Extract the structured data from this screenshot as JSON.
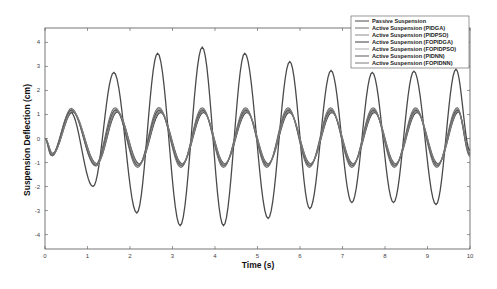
{
  "chart_data": {
    "type": "line",
    "title": "",
    "xlabel": "Time (s)",
    "ylabel": "Suspension Deflection (cm)",
    "xlim": [
      0,
      10
    ],
    "ylim": [
      -4.6,
      4.6
    ],
    "xticks": [
      0,
      1,
      2,
      3,
      4,
      5,
      6,
      7,
      8,
      9,
      10
    ],
    "yticks": [
      -4,
      -3,
      -2,
      -1,
      0,
      1,
      2,
      3,
      4
    ],
    "grid": false,
    "legend_position": "upper right",
    "series": [
      {
        "name": "Passive Suspension",
        "color": "#4a4a4a",
        "points": [
          [
            0,
            0
          ],
          [
            0.15,
            -0.7
          ],
          [
            0.6,
            1.1
          ],
          [
            1.13,
            -2.0
          ],
          [
            1.62,
            2.75
          ],
          [
            2.16,
            -3.1
          ],
          [
            2.65,
            3.55
          ],
          [
            3.18,
            -3.63
          ],
          [
            3.7,
            3.8
          ],
          [
            4.2,
            -3.63
          ],
          [
            4.7,
            3.55
          ],
          [
            5.25,
            -3.33
          ],
          [
            5.76,
            3.2
          ],
          [
            6.23,
            -2.92
          ],
          [
            6.73,
            2.83
          ],
          [
            7.22,
            -2.67
          ],
          [
            7.7,
            2.75
          ],
          [
            8.2,
            -2.67
          ],
          [
            8.68,
            2.8
          ],
          [
            9.2,
            -2.75
          ],
          [
            9.67,
            2.88
          ],
          [
            10,
            -0.5
          ]
        ]
      },
      {
        "name": "Active Suspension (PIDGA)",
        "color": "#6e6e6e",
        "points": [
          [
            0,
            0
          ],
          [
            0.17,
            -0.72
          ],
          [
            0.62,
            1.25
          ],
          [
            1.18,
            -1.1
          ],
          [
            1.65,
            1.28
          ],
          [
            2.18,
            -1.2
          ],
          [
            2.68,
            1.29
          ],
          [
            3.2,
            -1.2
          ],
          [
            3.7,
            1.28
          ],
          [
            4.2,
            -1.2
          ],
          [
            4.72,
            1.28
          ],
          [
            5.22,
            -1.2
          ],
          [
            5.72,
            1.28
          ],
          [
            6.22,
            -1.2
          ],
          [
            6.72,
            1.28
          ],
          [
            7.22,
            -1.2
          ],
          [
            7.72,
            1.28
          ],
          [
            8.22,
            -1.2
          ],
          [
            8.72,
            1.28
          ],
          [
            9.22,
            -1.2
          ],
          [
            9.7,
            1.28
          ],
          [
            10,
            -0.75
          ]
        ]
      },
      {
        "name": "Active Suspension (PIDPSO)",
        "color": "#8a8a8a",
        "points": [
          [
            0,
            0
          ],
          [
            0.16,
            -0.68
          ],
          [
            0.63,
            1.2
          ],
          [
            1.2,
            -1.15
          ],
          [
            1.67,
            1.22
          ],
          [
            2.2,
            -1.15
          ],
          [
            2.69,
            1.24
          ],
          [
            3.21,
            -1.15
          ],
          [
            3.71,
            1.23
          ],
          [
            4.21,
            -1.15
          ],
          [
            4.73,
            1.23
          ],
          [
            5.23,
            -1.15
          ],
          [
            5.73,
            1.23
          ],
          [
            6.23,
            -1.15
          ],
          [
            6.73,
            1.23
          ],
          [
            7.23,
            -1.15
          ],
          [
            7.73,
            1.23
          ],
          [
            8.23,
            -1.15
          ],
          [
            8.73,
            1.23
          ],
          [
            9.23,
            -1.15
          ],
          [
            9.71,
            1.23
          ],
          [
            10,
            -0.7
          ]
        ]
      },
      {
        "name": "Active Suspension  (FOPIDGA)",
        "color": "#3c3c3c",
        "points": [
          [
            0,
            0
          ],
          [
            0.18,
            -0.62
          ],
          [
            0.65,
            1.1
          ],
          [
            1.22,
            -1.05
          ],
          [
            1.7,
            1.1
          ],
          [
            2.22,
            -1.05
          ],
          [
            2.72,
            1.08
          ],
          [
            3.23,
            -1.05
          ],
          [
            3.73,
            1.08
          ],
          [
            4.23,
            -1.05
          ],
          [
            4.75,
            1.08
          ],
          [
            5.25,
            -1.05
          ],
          [
            5.75,
            1.08
          ],
          [
            6.25,
            -1.05
          ],
          [
            6.75,
            1.08
          ],
          [
            7.25,
            -1.05
          ],
          [
            7.75,
            1.08
          ],
          [
            8.25,
            -1.05
          ],
          [
            8.75,
            1.08
          ],
          [
            9.25,
            -1.05
          ],
          [
            9.73,
            1.1
          ],
          [
            10,
            -0.6
          ]
        ]
      },
      {
        "name": "Active Suspension (FOPIDPSO)",
        "color": "#a8a8a8",
        "points": [
          [
            0,
            0
          ],
          [
            0.17,
            -0.66
          ],
          [
            0.64,
            1.15
          ],
          [
            1.21,
            -1.08
          ],
          [
            1.68,
            1.15
          ],
          [
            2.21,
            -1.08
          ],
          [
            2.7,
            1.15
          ],
          [
            3.22,
            -1.08
          ],
          [
            3.72,
            1.15
          ],
          [
            4.22,
            -1.08
          ],
          [
            4.74,
            1.15
          ],
          [
            5.24,
            -1.08
          ],
          [
            5.74,
            1.15
          ],
          [
            6.24,
            -1.08
          ],
          [
            6.74,
            1.15
          ],
          [
            7.24,
            -1.08
          ],
          [
            7.74,
            1.15
          ],
          [
            8.24,
            -1.08
          ],
          [
            8.74,
            1.15
          ],
          [
            9.24,
            -1.08
          ],
          [
            9.72,
            1.15
          ],
          [
            10,
            -0.65
          ]
        ]
      },
      {
        "name": "Active Suspension (PIDNN)",
        "color": "#5a5a5a",
        "points": [
          [
            0,
            0
          ],
          [
            0.16,
            -0.7
          ],
          [
            0.62,
            1.18
          ],
          [
            1.19,
            -1.12
          ],
          [
            1.66,
            1.18
          ],
          [
            2.19,
            -1.12
          ],
          [
            2.69,
            1.18
          ],
          [
            3.21,
            -1.12
          ],
          [
            3.71,
            1.18
          ],
          [
            4.21,
            -1.12
          ],
          [
            4.73,
            1.18
          ],
          [
            5.23,
            -1.12
          ],
          [
            5.73,
            1.18
          ],
          [
            6.23,
            -1.12
          ],
          [
            6.73,
            1.18
          ],
          [
            7.23,
            -1.12
          ],
          [
            7.73,
            1.18
          ],
          [
            8.23,
            -1.12
          ],
          [
            8.73,
            1.18
          ],
          [
            9.23,
            -1.12
          ],
          [
            9.71,
            1.18
          ],
          [
            10,
            -0.68
          ]
        ]
      },
      {
        "name": "Active Suspension (FOPIDNN)",
        "color": "#7a7a7a",
        "points": [
          [
            0,
            0
          ],
          [
            0.18,
            -0.64
          ],
          [
            0.64,
            1.12
          ],
          [
            1.21,
            -1.06
          ],
          [
            1.69,
            1.12
          ],
          [
            2.21,
            -1.06
          ],
          [
            2.71,
            1.12
          ],
          [
            3.22,
            -1.06
          ],
          [
            3.72,
            1.12
          ],
          [
            4.22,
            -1.06
          ],
          [
            4.74,
            1.12
          ],
          [
            5.24,
            -1.06
          ],
          [
            5.74,
            1.12
          ],
          [
            6.24,
            -1.06
          ],
          [
            6.74,
            1.12
          ],
          [
            7.24,
            -1.06
          ],
          [
            7.74,
            1.12
          ],
          [
            8.24,
            -1.06
          ],
          [
            8.74,
            1.12
          ],
          [
            9.24,
            -1.06
          ],
          [
            9.72,
            1.12
          ],
          [
            10,
            -0.62
          ]
        ]
      }
    ]
  }
}
